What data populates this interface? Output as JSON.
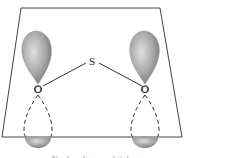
{
  "diagram": {
    "atoms": {
      "center": "S",
      "left": "O",
      "right": "O"
    },
    "caption": "Nonbonding p orbitals",
    "colors": {
      "lobe_fill": "#9a9a9a",
      "line": "#333333",
      "plane": "#444444"
    }
  }
}
